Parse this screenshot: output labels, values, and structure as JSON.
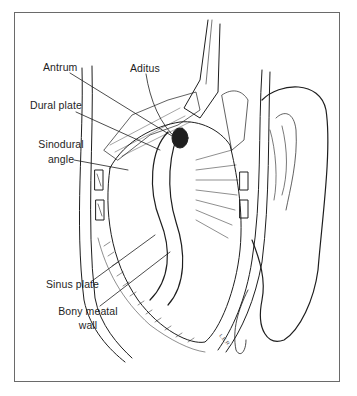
{
  "figure": {
    "frame": {
      "border_color": "#6a6a6a",
      "background": "#ffffff"
    },
    "ink_color": "#1e1e1e",
    "labels": [
      {
        "id": "antrum",
        "text": "Antrum"
      },
      {
        "id": "aditus",
        "text": "Aditus"
      },
      {
        "id": "dural_plate",
        "text": "Dural plate"
      },
      {
        "id": "sinodural_angle",
        "lines": [
          "Sinodural",
          "angle"
        ]
      },
      {
        "id": "sinus_plate",
        "text": "Sinus plate"
      },
      {
        "id": "bony_meatal_wall",
        "lines": [
          "Bony meatal",
          "wall"
        ]
      }
    ],
    "artist_signature": "L.E.R."
  }
}
